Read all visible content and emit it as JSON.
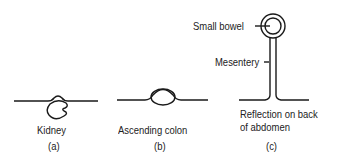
{
  "figure": {
    "panels": [
      {
        "id": "a",
        "label": "Kidney",
        "caption": "(a)"
      },
      {
        "id": "b",
        "label": "Ascending colon",
        "caption": "(b)"
      },
      {
        "id": "c",
        "label": "Reflection on back of abdomen",
        "label_line1": "Reflection on back",
        "label_line2": "of abdomen",
        "caption": "(c)",
        "annotations": [
          "Small bowel",
          "Mesentery"
        ]
      }
    ],
    "colors": {
      "stroke": "#1a1a1a",
      "background": "#ffffff"
    }
  }
}
